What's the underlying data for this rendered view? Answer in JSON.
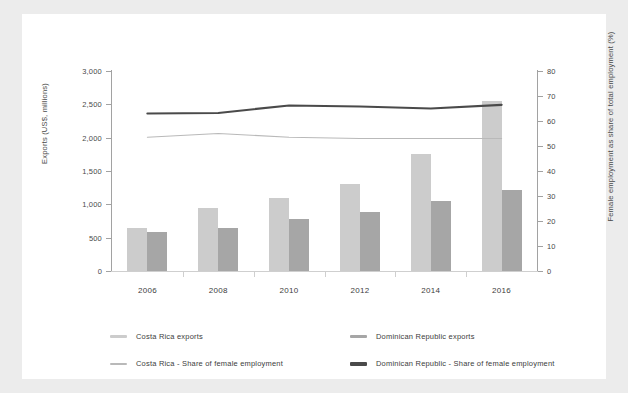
{
  "colors": {
    "background": "#ececec",
    "card": "#ffffff",
    "costa_rica_bar": "#cccccc",
    "dominican_bar": "#a6a6a6",
    "costa_rica_line": "#b9b9b9",
    "dominican_line": "#4a4a4a",
    "axis": "#a2a2a2",
    "text": "#3d3d3d"
  },
  "chart_data": {
    "type": "bar",
    "title": "",
    "subtitle": "",
    "xlabel": "",
    "ylabel": "Exports (US$, millions)",
    "y2label": "Female employment as share of total employment (%)",
    "categories": [
      "2006",
      "2008",
      "2010",
      "2012",
      "2014",
      "2016"
    ],
    "ylim": [
      0,
      3000
    ],
    "yticks": [
      "0",
      "500",
      "1,000",
      "1,500",
      "2,000",
      "2,500",
      "3,000"
    ],
    "ytick_values": [
      0,
      500,
      1000,
      1500,
      2000,
      2500,
      3000
    ],
    "y2lim": [
      0,
      80
    ],
    "y2ticks": [
      "0",
      "10",
      "20",
      "30",
      "40",
      "50",
      "60",
      "70",
      "80"
    ],
    "y2tick_values": [
      0,
      10,
      20,
      30,
      40,
      50,
      60,
      70,
      80
    ],
    "grid": false,
    "legend_position": "bottom",
    "series": [
      {
        "name": "Costa Rica exports",
        "kind": "bar",
        "axis": "left",
        "color": "#cccccc",
        "values": [
          650,
          950,
          1100,
          1300,
          1750,
          2550
        ]
      },
      {
        "name": "Dominican Republic exports",
        "kind": "bar",
        "axis": "left",
        "color": "#a6a6a6",
        "values": [
          590,
          650,
          780,
          880,
          1050,
          1210
        ]
      },
      {
        "name": "Costa Rica - Share of female employment",
        "kind": "line",
        "axis": "right",
        "color": "#b9b9b9",
        "values": [
          53.5,
          55.0,
          53.5,
          53.0,
          53.0,
          53.0
        ]
      },
      {
        "name": "Dominican Republic - Share of female employment",
        "kind": "line",
        "axis": "right",
        "color": "#4a4a4a",
        "values": [
          63.0,
          63.2,
          66.2,
          65.8,
          65.0,
          66.5
        ]
      }
    ]
  },
  "axes": {
    "left_title": "Exports (US$, millions)",
    "right_title": "Female employment as share of total employment (%)"
  },
  "legend": {
    "items": [
      {
        "label": "Costa Rica exports",
        "color": "#cccccc",
        "thickness": "3px"
      },
      {
        "label": "Dominican Republic exports",
        "color": "#a6a6a6",
        "thickness": "3px"
      },
      {
        "label": "Costa Rica - Share of female employment",
        "color": "#b9b9b9",
        "thickness": "2px"
      },
      {
        "label": "Dominican Republic - Share of female employment",
        "color": "#4a4a4a",
        "thickness": "4px"
      }
    ]
  }
}
